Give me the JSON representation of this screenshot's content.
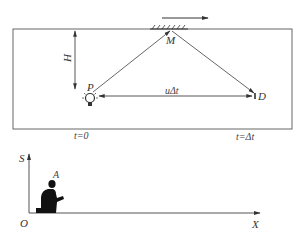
{
  "diagram": {
    "top_panel": {
      "labels": {
        "mirror_point": "M",
        "source": "P",
        "detector": "D",
        "height": "H",
        "displacement": "uΔt",
        "time_start": "t=0",
        "time_end": "t=Δt"
      },
      "elements": [
        "moving-frame-box",
        "mirror-hatched",
        "velocity-arrow",
        "light-source-bulb",
        "detector",
        "ray-P-to-M",
        "ray-M-to-D",
        "height-arrow",
        "displacement-arrow"
      ]
    },
    "bottom_panel": {
      "labels": {
        "y_axis": "S",
        "x_axis": "X",
        "origin": "O",
        "observer": "A"
      },
      "elements": [
        "y-axis",
        "x-axis",
        "observer-silhouette"
      ]
    },
    "colors": {
      "line": "#555555",
      "box": "#666666",
      "text": "#333333",
      "figure": "#111111"
    }
  }
}
